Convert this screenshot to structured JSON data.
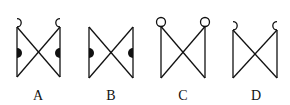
{
  "figures": [
    {
      "label": "A",
      "top_decoration": "hooks",
      "side_decoration": "filled-half-discs"
    },
    {
      "label": "B",
      "top_decoration": "none",
      "side_decoration": "filled-half-discs"
    },
    {
      "label": "C",
      "top_decoration": "circles",
      "side_decoration": "none"
    },
    {
      "label": "D",
      "top_decoration": "hooks",
      "side_decoration": "none"
    }
  ],
  "colors": {
    "stroke": "#111111",
    "fill": "#111111",
    "background": "#ffffff"
  }
}
